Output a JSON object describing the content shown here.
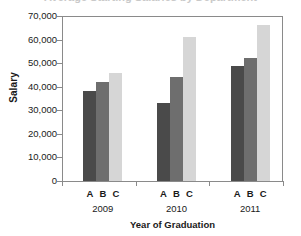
{
  "chart_data": {
    "type": "bar",
    "title": "",
    "xlabel": "Year of Graduation",
    "ylabel": "Salary",
    "categories": [
      "2009",
      "2010",
      "2011"
    ],
    "group_members": [
      "A",
      "B",
      "C"
    ],
    "series": [
      {
        "name": "A",
        "values": [
          38000,
          33000,
          49000
        ],
        "color": "#4a4a4a"
      },
      {
        "name": "B",
        "values": [
          42000,
          44000,
          52000
        ],
        "color": "#6e6e6e"
      },
      {
        "name": "C",
        "values": [
          46000,
          61000,
          66000
        ],
        "color": "#d6d6d6"
      }
    ],
    "ylim": [
      0,
      70000
    ],
    "ytick_values": [
      70000,
      60000,
      50000,
      40000,
      30000,
      20000,
      10000,
      0
    ],
    "ytick_labels": [
      "70,000",
      "60,000",
      "50,000",
      "40,000",
      "30,000",
      "20,000",
      "10,000",
      "0"
    ],
    "grid": false,
    "legend": "none"
  },
  "title_sliver": "Average Starting Salaries by Department",
  "axis": {
    "y_title": "Salary",
    "x_title": "Year of Graduation"
  }
}
